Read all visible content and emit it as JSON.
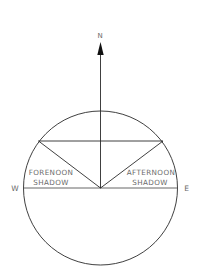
{
  "diagram": {
    "compass": {
      "north": "N",
      "west": "W",
      "east": "E"
    },
    "labels": {
      "forenoon_line1": "FORENOON",
      "forenoon_line2": "SHADOW",
      "afternoon_line1": "AFTERNOON",
      "afternoon_line2": "SHADOW"
    },
    "colors": {
      "stroke": "#2a2a2a",
      "text": "#6a6a6a",
      "background": "#ffffff"
    }
  }
}
